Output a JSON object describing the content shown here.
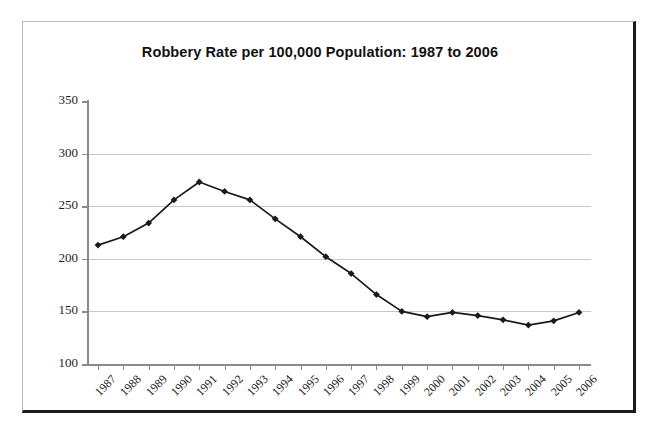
{
  "chart_data": {
    "type": "line",
    "title": "Robbery Rate per 100,000 Population: 1987 to 2006",
    "xlabel": "",
    "ylabel": "",
    "categories": [
      "1987",
      "1988",
      "1989",
      "1990",
      "1991",
      "1992",
      "1993",
      "1994",
      "1995",
      "1996",
      "1997",
      "1998",
      "1999",
      "2000",
      "2001",
      "2002",
      "2003",
      "2004",
      "2005",
      "2006"
    ],
    "values": [
      213,
      221,
      234,
      256,
      273,
      264,
      256,
      238,
      221,
      202,
      186,
      166,
      150,
      145,
      149,
      146,
      142,
      137,
      141,
      149
    ],
    "series": [
      {
        "name": "Robbery rate",
        "values": [
          213,
          221,
          234,
          256,
          273,
          264,
          256,
          238,
          221,
          202,
          186,
          166,
          150,
          145,
          149,
          146,
          142,
          137,
          141,
          149
        ]
      }
    ],
    "ylim": [
      100,
      350
    ],
    "ytick_values": [
      100,
      150,
      200,
      250,
      300,
      350
    ],
    "ytick_labels": [
      "100",
      "150",
      "200",
      "250",
      "300",
      "350"
    ],
    "grid": true,
    "grid_axis": "y",
    "legend": false,
    "legend_position": "none",
    "marker": "diamond",
    "line_color": "#1a1a1a",
    "marker_color": "#1a1a1a",
    "gridline_color": "#c8c8c8",
    "axis_color": "#8a8a8a",
    "plot_background": "#ffffff",
    "xtick_rotation": -45
  },
  "frame": {
    "border_light_color": "#b9b9b9",
    "border_dark_color": "#1a1a1a"
  }
}
